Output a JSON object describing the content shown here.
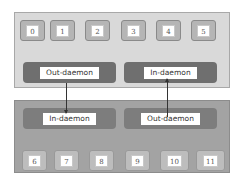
{
  "top_panel": {
    "slots": [
      "0",
      "1",
      "2",
      "3",
      "4",
      "5"
    ],
    "daemons": [
      {
        "label": "Out-daemon"
      },
      {
        "label": "In-daemon"
      }
    ]
  },
  "bottom_panel": {
    "daemons": [
      {
        "label": "In-daemon"
      },
      {
        "label": "Out-daemon"
      }
    ],
    "slots": [
      "6",
      "7",
      "8",
      "9",
      "10",
      "11"
    ]
  },
  "connections": [
    {
      "from": "top Out-daemon",
      "to": "bottom In-daemon",
      "direction": "down"
    },
    {
      "from": "bottom Out-daemon",
      "to": "top In-daemon",
      "direction": "up"
    }
  ],
  "colors": {
    "top_panel_bg": "#d9d9d9",
    "bottom_panel_bg": "#a3a3a3",
    "daemon_bg": "#6f6f6f",
    "arrow": "#333333"
  }
}
